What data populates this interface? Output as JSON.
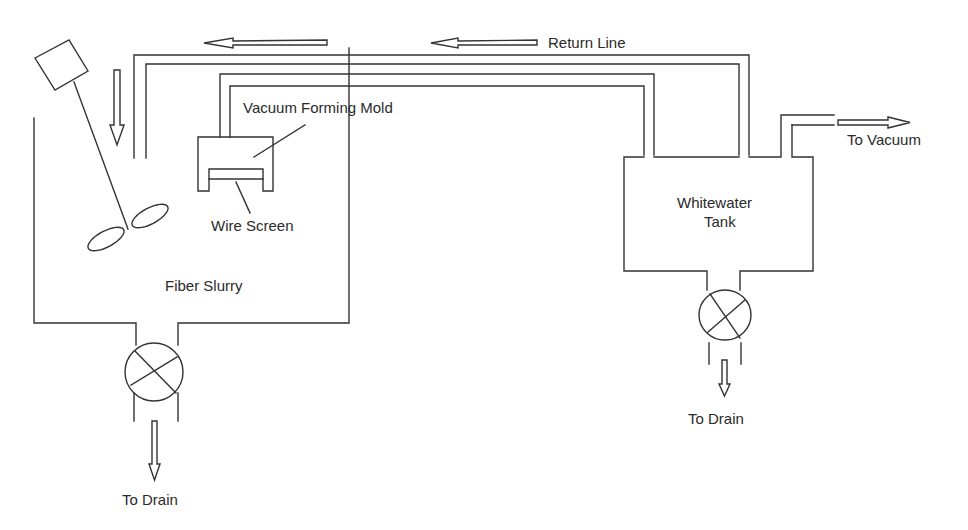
{
  "diagram": {
    "type": "process-flow",
    "labels": {
      "return_line": "Return Line",
      "vacuum_forming_mold": "Vacuum Forming Mold",
      "wire_screen": "Wire Screen",
      "fiber_slurry": "Fiber Slurry",
      "whitewater_tank": "Whitewater",
      "whitewater_tank_2": "Tank",
      "to_vacuum": "To Vacuum",
      "to_drain_left": "To Drain",
      "to_drain_right": "To Drain"
    },
    "components": [
      {
        "id": "slurry-tank",
        "label": "Fiber Slurry"
      },
      {
        "id": "agitator",
        "label": ""
      },
      {
        "id": "mold",
        "label": "Vacuum Forming Mold"
      },
      {
        "id": "wire-screen",
        "label": "Wire Screen"
      },
      {
        "id": "whitewater-tank",
        "label": "Whitewater Tank"
      },
      {
        "id": "valve-left",
        "label": ""
      },
      {
        "id": "valve-right",
        "label": ""
      }
    ],
    "flows": [
      {
        "from": "whitewater-tank",
        "to": "slurry-tank",
        "label": "Return Line"
      },
      {
        "from": "mold",
        "to": "whitewater-tank",
        "label": ""
      },
      {
        "from": "whitewater-tank",
        "to": "vacuum",
        "label": "To Vacuum"
      },
      {
        "from": "slurry-tank",
        "to": "drain",
        "label": "To Drain"
      },
      {
        "from": "whitewater-tank",
        "to": "drain",
        "label": "To Drain"
      }
    ]
  }
}
